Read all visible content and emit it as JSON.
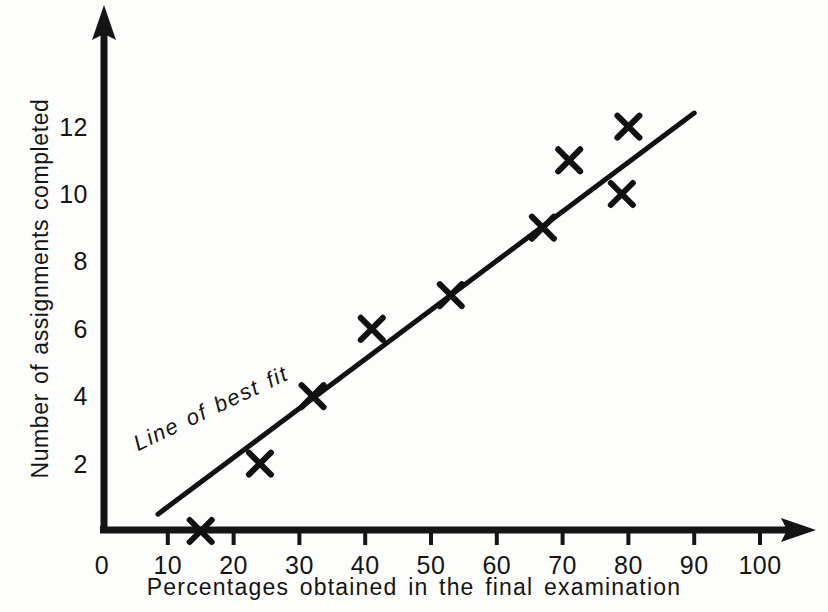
{
  "chart_data": {
    "type": "scatter",
    "title": "",
    "xlabel": "Percentages obtained in the final examination",
    "ylabel": "Number of assignments completed",
    "xlim": [
      0,
      107
    ],
    "ylim": [
      0,
      13.6
    ],
    "grid": false,
    "legend": "none",
    "x_ticks": [
      0,
      10,
      20,
      30,
      40,
      50,
      60,
      70,
      80,
      90,
      100
    ],
    "x_tick_labels": [
      "0",
      "10",
      "20",
      "30",
      "40",
      "50",
      "60",
      "70",
      "80",
      "90",
      "100"
    ],
    "y_ticks": [
      2,
      4,
      6,
      8,
      10,
      12
    ],
    "y_tick_labels": [
      "2",
      "4",
      "6",
      "8",
      "10",
      "12"
    ],
    "marker": "x",
    "marker_color": "#111111",
    "points": [
      {
        "x": 15,
        "y": 0
      },
      {
        "x": 24,
        "y": 2
      },
      {
        "x": 32,
        "y": 4
      },
      {
        "x": 41,
        "y": 6
      },
      {
        "x": 53,
        "y": 7
      },
      {
        "x": 67,
        "y": 9
      },
      {
        "x": 71,
        "y": 11
      },
      {
        "x": 79,
        "y": 10
      },
      {
        "x": 80,
        "y": 12
      }
    ],
    "trendline": {
      "label": "Line of best fit",
      "x0": 8.5,
      "y0": 0.5,
      "x1": 90,
      "y1": 12.4,
      "color": "#111111"
    },
    "annotations": [
      {
        "text": "Line of best fit",
        "x": 18,
        "y": 2.6,
        "rotation": -25.5,
        "style": "italic"
      }
    ],
    "axis_style": {
      "color": "#151515",
      "arrow_heads": true,
      "spines": [
        "left",
        "bottom"
      ]
    }
  },
  "axis_titles": {
    "x": "Percentages obtained in the final examination",
    "y": "Number of assignments completed"
  },
  "trend_label": "Line of best fit"
}
